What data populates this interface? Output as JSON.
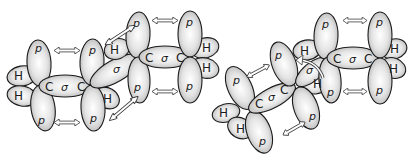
{
  "figure": {
    "colors": {
      "stroke": "#1a1a1a",
      "shade": "#bdbdbd",
      "background": "#ffffff"
    }
  },
  "labels": {
    "p": "p",
    "H": "H",
    "C": "C",
    "sigma": "σ"
  },
  "left_molecule": {
    "name": "s-trans butadiene",
    "carbons": [
      {
        "id": "C1",
        "x": 40,
        "y": 86
      },
      {
        "id": "C2",
        "x": 90,
        "y": 86
      },
      {
        "id": "C3",
        "x": 140,
        "y": 57
      },
      {
        "id": "C4",
        "x": 190,
        "y": 57
      }
    ],
    "sigma_bonds": [
      "C1-C2",
      "C2-C3",
      "C3-C4"
    ],
    "overlap_arrows": 6
  },
  "right_molecule": {
    "name": "twisted butadiene",
    "carbons": [
      {
        "id": "C1",
        "x": 250,
        "y": 110
      },
      {
        "id": "C2",
        "x": 295,
        "y": 86
      },
      {
        "id": "C3",
        "x": 328,
        "y": 58
      },
      {
        "id": "C4",
        "x": 378,
        "y": 58
      }
    ],
    "sigma_bonds": [
      "C1-C2",
      "C2-C3",
      "C3-C4"
    ],
    "overlap_arrows": 4,
    "rotation_arrow": true
  }
}
